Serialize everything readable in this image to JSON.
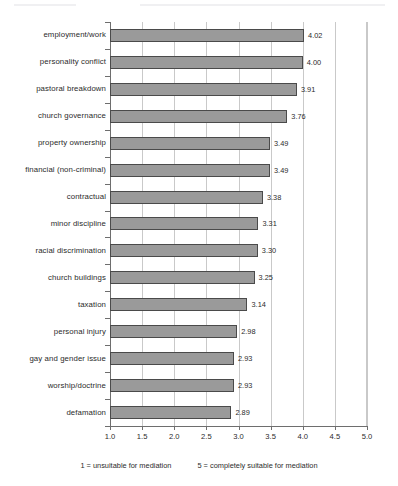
{
  "chart_data": {
    "type": "bar",
    "orientation": "horizontal",
    "title": "",
    "xlabel": "",
    "ylabel": "",
    "xlim": [
      1.0,
      5.0
    ],
    "xticks": [
      "1.0",
      "1.5",
      "2.0",
      "2.5",
      "3.0",
      "3.5",
      "4.0",
      "4.5",
      "5.0"
    ],
    "grid": true,
    "legend_position": "below",
    "categories": [
      "employment/work",
      "personality conflict",
      "pastoral breakdown",
      "church governance",
      "property ownership",
      "financial (non-criminal)",
      "contractual",
      "minor discipline",
      "racial discrimination",
      "church buildings",
      "taxation",
      "personal injury",
      "gay and gender issue",
      "worship/doctrine",
      "defamation"
    ],
    "values": [
      4.02,
      4.0,
      3.91,
      3.76,
      3.49,
      3.49,
      3.38,
      3.31,
      3.3,
      3.25,
      3.14,
      2.98,
      2.93,
      2.93,
      2.89
    ],
    "value_labels": [
      "4.02",
      "4.00",
      "3.91",
      "3.76",
      "3.49",
      "3.49",
      "3.38",
      "3.31",
      "3.30",
      "3.25",
      "3.14",
      "2.98",
      "2.93",
      "2.93",
      "2.89"
    ],
    "annotations": [
      "1 = unsuitable for mediation",
      "5 = completely suitable for mediation"
    ],
    "colors": {
      "bar_fill": "#9a9a9a",
      "bar_outline": "#4a4a4a",
      "gridline": "#c9c9c9",
      "axis": "#6e6e6e",
      "text": "#2b2b2b",
      "background": "#ffffff"
    }
  },
  "footer": {
    "left_note": "1 = unsuitable for mediation",
    "right_note": "5 = completely suitable for mediation"
  }
}
